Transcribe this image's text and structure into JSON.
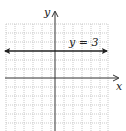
{
  "diagram": {
    "axes": {
      "x_label": "x",
      "y_label": "y"
    },
    "line": {
      "equation": "y = 3",
      "y_value": 3,
      "orientation": "horizontal",
      "arrows": "both"
    },
    "grid": {
      "style": "dotted",
      "color": "#b8b8b8",
      "x_range": [
        -6,
        6
      ],
      "y_range": [
        -6,
        6
      ]
    },
    "colors": {
      "axis": "#333333",
      "line": "#222222"
    }
  }
}
